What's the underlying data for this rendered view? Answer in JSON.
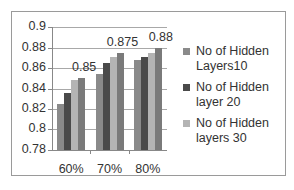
{
  "chart_data": {
    "type": "bar",
    "title": "",
    "xlabel": "",
    "ylabel": "",
    "categories": [
      "60%",
      "70%",
      "80%"
    ],
    "ylim": [
      0.78,
      0.9
    ],
    "yticks": [
      "0.9",
      "0.88",
      "0.86",
      "0.84",
      "0.82",
      "0.8",
      "0.78"
    ],
    "grid": true,
    "legend_position": "right",
    "series": [
      {
        "name": "No of Hidden Layers10",
        "color": "#8a8a8a",
        "values": [
          0.825,
          0.854,
          0.868
        ],
        "in_legend": true
      },
      {
        "name": "No of Hidden layer 20",
        "color": "#4a4a4a",
        "values": [
          0.836,
          0.865,
          0.871
        ],
        "in_legend": true
      },
      {
        "name": "No of Hidden layers 30",
        "color": "#b4b4b4",
        "values": [
          0.848,
          0.871,
          0.875
        ],
        "in_legend": true
      },
      {
        "name": "",
        "color": "#7a7a7a",
        "values": [
          0.85,
          0.875,
          0.88
        ],
        "in_legend": false
      }
    ],
    "data_labels": [
      "0.85",
      "0.875",
      "0.88"
    ]
  },
  "legend": {
    "items": [
      {
        "line1": "No of Hidden",
        "line2": "Layers10"
      },
      {
        "line1": "No of Hidden",
        "line2": "layer 20"
      },
      {
        "line1": "No of Hidden",
        "line2": "layers 30"
      }
    ]
  }
}
